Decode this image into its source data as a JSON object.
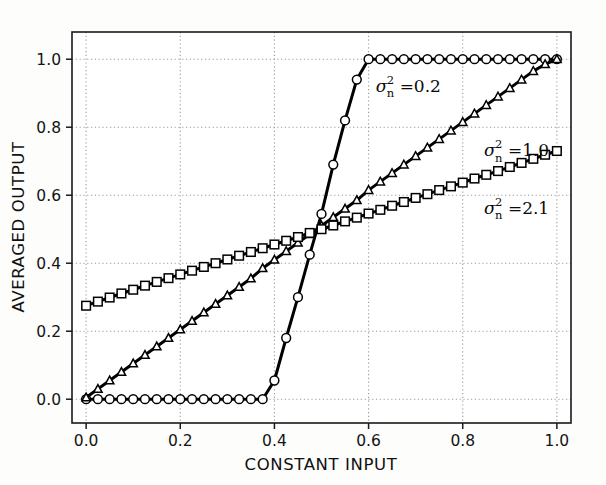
{
  "chart_data": {
    "type": "line",
    "title": "",
    "xlabel": "CONSTANT INPUT",
    "ylabel": "AVERAGED OUTPUT",
    "xlim": [
      -0.03,
      1.03
    ],
    "ylim": [
      -0.07,
      1.08
    ],
    "xticks": [
      0.0,
      0.2,
      0.4,
      0.6,
      0.8,
      1.0
    ],
    "yticks": [
      0.0,
      0.2,
      0.4,
      0.6,
      0.8,
      1.0
    ],
    "xtick_labels": [
      "0.0",
      "0.2",
      "0.4",
      "0.6",
      "0.8",
      "1.0"
    ],
    "ytick_labels": [
      "0.0",
      "0.2",
      "0.4",
      "0.6",
      "0.8",
      "1.0"
    ],
    "grid": true,
    "grid_style": "dotted",
    "grid_color": "#9a9a9a",
    "legend": "none",
    "line_color": "#000000",
    "marker_facecolor": "#ffffff",
    "marker_edgecolor": "#000000",
    "background": "#ffffff",
    "series": [
      {
        "name": "sigma_n^2 = 0.2",
        "marker": "circle",
        "x": [
          0.0,
          0.025,
          0.05,
          0.075,
          0.1,
          0.125,
          0.15,
          0.175,
          0.2,
          0.225,
          0.25,
          0.275,
          0.3,
          0.325,
          0.35,
          0.375,
          0.4,
          0.425,
          0.45,
          0.475,
          0.5,
          0.525,
          0.55,
          0.575,
          0.6,
          0.625,
          0.65,
          0.675,
          0.7,
          0.725,
          0.75,
          0.775,
          0.8,
          0.825,
          0.85,
          0.875,
          0.9,
          0.925,
          0.95,
          0.975,
          1.0
        ],
        "y": [
          0.0,
          0.0,
          0.0,
          0.0,
          0.0,
          0.0,
          0.0,
          0.0,
          0.0,
          0.0,
          0.0,
          0.0,
          0.0,
          0.0,
          0.0,
          0.0,
          0.055,
          0.18,
          0.3,
          0.425,
          0.545,
          0.69,
          0.82,
          0.94,
          1.0,
          1.0,
          1.0,
          1.0,
          1.0,
          1.0,
          1.0,
          1.0,
          1.0,
          1.0,
          1.0,
          1.0,
          1.0,
          1.0,
          1.0,
          1.0,
          1.0
        ]
      },
      {
        "name": "sigma_n^2 = 1.0",
        "marker": "triangle",
        "x": [
          0.0,
          0.025,
          0.05,
          0.075,
          0.1,
          0.125,
          0.15,
          0.175,
          0.2,
          0.225,
          0.25,
          0.275,
          0.3,
          0.325,
          0.35,
          0.375,
          0.4,
          0.425,
          0.45,
          0.475,
          0.5,
          0.525,
          0.55,
          0.575,
          0.6,
          0.625,
          0.65,
          0.675,
          0.7,
          0.725,
          0.75,
          0.775,
          0.8,
          0.825,
          0.85,
          0.875,
          0.9,
          0.925,
          0.95,
          0.975,
          1.0
        ],
        "y": [
          0.005,
          0.03,
          0.055,
          0.08,
          0.105,
          0.13,
          0.155,
          0.18,
          0.205,
          0.23,
          0.255,
          0.28,
          0.305,
          0.33,
          0.355,
          0.385,
          0.41,
          0.435,
          0.46,
          0.485,
          0.51,
          0.535,
          0.56,
          0.585,
          0.615,
          0.64,
          0.665,
          0.69,
          0.715,
          0.74,
          0.765,
          0.79,
          0.815,
          0.84,
          0.865,
          0.89,
          0.915,
          0.94,
          0.965,
          0.985,
          1.0
        ]
      },
      {
        "name": "sigma_n^2 = 2.1",
        "marker": "square",
        "x": [
          0.0,
          0.025,
          0.05,
          0.075,
          0.1,
          0.125,
          0.15,
          0.175,
          0.2,
          0.225,
          0.25,
          0.275,
          0.3,
          0.325,
          0.35,
          0.375,
          0.4,
          0.425,
          0.45,
          0.475,
          0.5,
          0.525,
          0.55,
          0.575,
          0.6,
          0.625,
          0.65,
          0.675,
          0.7,
          0.725,
          0.75,
          0.775,
          0.8,
          0.825,
          0.85,
          0.875,
          0.9,
          0.925,
          0.95,
          0.975,
          1.0
        ],
        "y": [
          0.275,
          0.287,
          0.299,
          0.311,
          0.322,
          0.334,
          0.345,
          0.356,
          0.367,
          0.378,
          0.389,
          0.4,
          0.411,
          0.422,
          0.433,
          0.444,
          0.455,
          0.466,
          0.477,
          0.489,
          0.5,
          0.511,
          0.523,
          0.534,
          0.546,
          0.557,
          0.569,
          0.58,
          0.592,
          0.603,
          0.615,
          0.626,
          0.637,
          0.649,
          0.66,
          0.671,
          0.683,
          0.695,
          0.707,
          0.719,
          0.73
        ]
      }
    ],
    "annotations": [
      {
        "id": "ann-0-2",
        "symbol": "σ",
        "superscript": "2",
        "subscript": "n",
        "equals": "=0.2",
        "full_text": "σ²ₙ =0.2",
        "x": 0.615,
        "y": 0.905
      },
      {
        "id": "ann-1-0",
        "symbol": "σ",
        "superscript": "2",
        "subscript": "n",
        "equals": "=1.0",
        "full_text": "σ²ₙ =1.0",
        "x": 0.845,
        "y": 0.715
      },
      {
        "id": "ann-2-1",
        "symbol": "σ",
        "superscript": "2",
        "subscript": "n",
        "equals": "=2.1",
        "full_text": "σ²ₙ =2.1",
        "x": 0.845,
        "y": 0.545
      }
    ]
  }
}
